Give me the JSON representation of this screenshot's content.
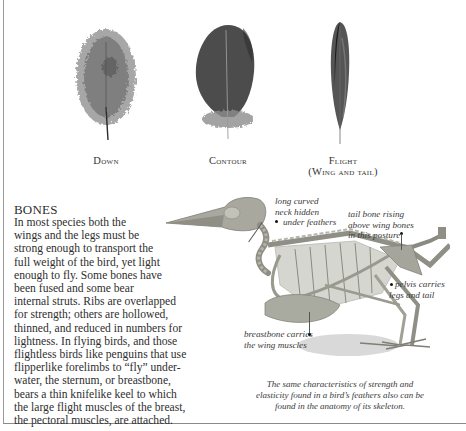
{
  "feathers": [
    {
      "id": "down",
      "caption": "Down",
      "caption_sub": ""
    },
    {
      "id": "contour",
      "caption": "Contour",
      "caption_sub": ""
    },
    {
      "id": "flight",
      "caption": "Flight",
      "caption_sub": "(Wing and tail)"
    }
  ],
  "bones": {
    "title": "BONES",
    "lines": [
      "In most species both the",
      "wings and the legs must be",
      "strong enough to transport the",
      "full weight of the bird, yet light",
      "enough to fly. Some bones have",
      "been fused and some bear",
      "internal struts. Ribs are overlapped",
      "for strength; others are hollowed,",
      "thinned, and reduced in numbers for",
      "lightness. In flying birds, and those",
      "flightless birds like penguins that use",
      "flipperlike forelimbs to “fly” under-",
      "water, the sternum, or breastbone,",
      "bears a thin knifelike keel to which",
      "the large flight muscles of the breast,",
      "the pectoral muscles, are attached."
    ]
  },
  "skeleton_labels": {
    "neck": [
      "long curved",
      "neck hidden",
      "under feathers"
    ],
    "tail": [
      "tail bone rising",
      "above wing bones",
      "in this posture"
    ],
    "pelvis": [
      "pelvis carries",
      "legs and tail"
    ],
    "breastbone": [
      "breastbone carries",
      "the wing muscles"
    ]
  },
  "figure_caption": [
    "The same characteristics of strength and",
    "elasticity found in a bird’s feathers also can be",
    "found in the anatomy of its skeleton."
  ],
  "colors": {
    "text": "#2e2e2e",
    "frame": "#9a9a9a",
    "feather_dark": "#3c3c3c",
    "bone": "#a9aaa0"
  }
}
